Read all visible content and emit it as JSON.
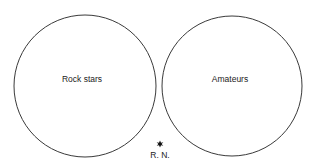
{
  "diagram": {
    "type": "venn",
    "sets": [
      {
        "id": "rock-stars",
        "label": "Rock stars",
        "cx": 85,
        "cy": 86,
        "r": 71,
        "label_x": 82,
        "label_y": 82
      },
      {
        "id": "amateurs",
        "label": "Amateurs",
        "cx": 232,
        "cy": 86,
        "r": 70,
        "label_x": 230,
        "label_y": 82
      }
    ],
    "overlap": "none",
    "marker": {
      "symbol": "star",
      "label": "R. N.",
      "x": 160,
      "y": 144,
      "label_y": 158,
      "position": "outside both sets, between them"
    },
    "colors": {
      "stroke": "#3a3a3a",
      "text": "#222222",
      "background": "#ffffff"
    }
  }
}
